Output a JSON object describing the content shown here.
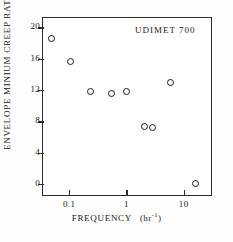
{
  "chart_data": {
    "type": "scatter",
    "title": "",
    "annotation": "UDIMET 700",
    "xlabel_text": "FREQUENCY",
    "xlabel_unit_open": "(hr",
    "xlabel_unit_exp": "-1",
    "xlabel_unit_close": ")",
    "ylabel_text": "ENVELOPE MINIUM CREEP RATE",
    "ylabel_unit_open": "(10",
    "ylabel_unit_exp1": "-5",
    "ylabel_unit_mid": "sec",
    "ylabel_unit_exp2": "-1",
    "ylabel_unit_close": ")",
    "xscale": "log",
    "yscale": "linear",
    "xlim": [
      0.035,
      30
    ],
    "ylim": [
      -1.4,
      21.2
    ],
    "grid": false,
    "legend": "none",
    "xticks": [
      0.1,
      1,
      10
    ],
    "xtick_labels": [
      "0.1",
      "1",
      "10"
    ],
    "yticks": [
      0,
      4,
      8,
      12,
      16,
      20
    ],
    "ytick_labels": [
      "0",
      "4",
      "8",
      "12",
      "16",
      "20"
    ],
    "marker_style": "open-circle",
    "x": [
      0.05,
      0.105,
      0.24,
      0.56,
      1.0,
      2.1,
      2.9,
      6.0,
      16.0
    ],
    "y": [
      18.6,
      15.6,
      11.8,
      11.5,
      11.8,
      7.4,
      7.2,
      13.0,
      0.1
    ],
    "points": [
      {
        "x": 0.05,
        "y": 18.6
      },
      {
        "x": 0.105,
        "y": 15.6
      },
      {
        "x": 0.24,
        "y": 11.8
      },
      {
        "x": 0.56,
        "y": 11.5
      },
      {
        "x": 1.0,
        "y": 11.8
      },
      {
        "x": 2.1,
        "y": 7.4
      },
      {
        "x": 2.9,
        "y": 7.2
      },
      {
        "x": 6.0,
        "y": 13.0
      },
      {
        "x": 16.0,
        "y": 0.1
      }
    ],
    "colors": {
      "axis": "#2b2b2b",
      "marker": "#1a1a1a",
      "background": "#ffffff",
      "page": "#fdfdfc"
    }
  }
}
